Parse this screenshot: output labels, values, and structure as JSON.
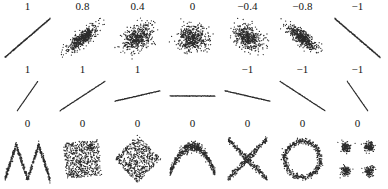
{
  "figure": {
    "background_color": "#ffffff",
    "point_color": "#2b2b2b",
    "label_color": "#141414"
  },
  "chart_data": {
    "type": "scatter",
    "title": "",
    "subtitle": "",
    "xlabel": "",
    "ylabel": "",
    "grid": false,
    "axes_visible": false,
    "legend": "none",
    "rows": [
      {
        "row_index": 1,
        "row_name": "varying-linear-correlation",
        "note": "Bivariate normal clouds whose correlation decreases from +1 to -1",
        "panels": [
          {
            "label": "1",
            "value": 1,
            "shape": "line-positive",
            "n": 320,
            "noise": 0.0,
            "slope": 1.0
          },
          {
            "label": "0.8",
            "value": 0.8,
            "shape": "cloud-correlated",
            "n": 520,
            "noise": 1.0,
            "slope": 0.8
          },
          {
            "label": "0.4",
            "value": 0.4,
            "shape": "cloud-correlated",
            "n": 520,
            "noise": 1.0,
            "slope": 0.4
          },
          {
            "label": "0",
            "value": 0,
            "shape": "cloud-correlated",
            "n": 520,
            "noise": 1.0,
            "slope": 0.0
          },
          {
            "label": "−0.4",
            "value": -0.4,
            "shape": "cloud-correlated",
            "n": 520,
            "noise": 1.0,
            "slope": -0.4
          },
          {
            "label": "−0.8",
            "value": -0.8,
            "shape": "cloud-correlated",
            "n": 520,
            "noise": 1.0,
            "slope": -0.8
          },
          {
            "label": "−1",
            "value": -1,
            "shape": "line-negative",
            "n": 320,
            "noise": 0.0,
            "slope": -1.0
          }
        ]
      },
      {
        "row_index": 2,
        "row_name": "varying-slope-perfect-correlation",
        "note": "Correlation reflects the direction but not the slope of a linear relationship; the horizontal line has undefined correlation",
        "panels": [
          {
            "label": "1",
            "value": 1,
            "shape": "line-slope",
            "slope": 2.2,
            "n": 300
          },
          {
            "label": "1",
            "value": 1,
            "shape": "line-slope",
            "slope": 1.0,
            "n": 300
          },
          {
            "label": "1",
            "value": 1,
            "shape": "line-slope",
            "slope": 0.35,
            "n": 300
          },
          {
            "label": "",
            "value": null,
            "shape": "line-slope",
            "slope": 0.0,
            "n": 300
          },
          {
            "label": "−1",
            "value": -1,
            "shape": "line-slope",
            "slope": -0.35,
            "n": 300
          },
          {
            "label": "−1",
            "value": -1,
            "shape": "line-slope",
            "slope": -1.0,
            "n": 300
          },
          {
            "label": "−1",
            "value": -1,
            "shape": "line-slope",
            "slope": -2.2,
            "n": 300
          }
        ]
      },
      {
        "row_index": 3,
        "row_name": "nonlinear-zero-correlation",
        "note": "Nonlinear relationships whose Pearson correlation is zero",
        "panels": [
          {
            "label": "0",
            "value": 0,
            "shape": "w-shape",
            "n": 560
          },
          {
            "label": "0",
            "value": 0,
            "shape": "square",
            "n": 620
          },
          {
            "label": "0",
            "value": 0,
            "shape": "diamond",
            "n": 560
          },
          {
            "label": "0",
            "value": 0,
            "shape": "parabola-up",
            "n": 560
          },
          {
            "label": "0",
            "value": 0,
            "shape": "x-cross",
            "n": 520
          },
          {
            "label": "0",
            "value": 0,
            "shape": "ring",
            "n": 520
          },
          {
            "label": "0",
            "value": 0,
            "shape": "four-clusters",
            "n": 520
          }
        ]
      }
    ]
  }
}
